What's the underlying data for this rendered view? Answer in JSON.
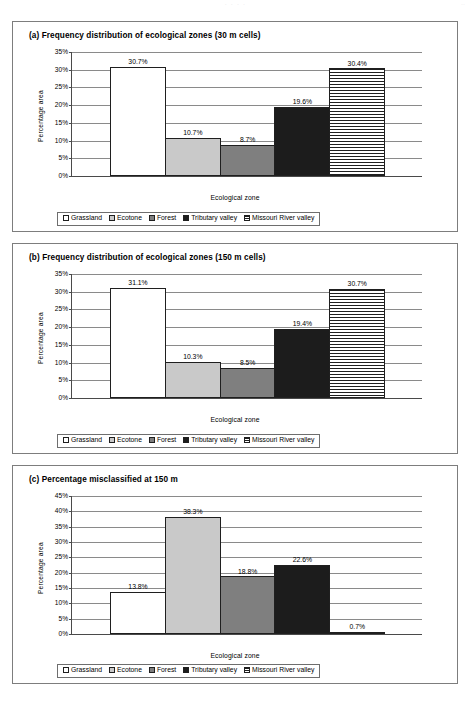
{
  "scan": {
    "header_artifact": "·   ·          ·                    ·",
    "folio_artifact": "··"
  },
  "legend": {
    "items": [
      {
        "label": "Grassland",
        "fill": "f-white",
        "color": "#ffffff"
      },
      {
        "label": "Ecotone",
        "fill": "f-ltgray",
        "color": "#c9c9c9"
      },
      {
        "label": "Forest",
        "fill": "f-gray",
        "color": "#7f7f7f"
      },
      {
        "label": "Tributary valley",
        "fill": "f-black",
        "color": "#1c1c1c"
      },
      {
        "label": "Missouri River valley",
        "fill": "f-stripe",
        "color": "#ffffff"
      }
    ]
  },
  "axis": {
    "ylabel": "Percentage area",
    "xlabel": "Ecological zone"
  },
  "panels": [
    {
      "id": "a",
      "title": "(a) Frequency distribution of ecological zones (30 m cells)"
    },
    {
      "id": "b",
      "title": "(b) Frequency distribution of ecological zones (150 m cells)"
    },
    {
      "id": "c",
      "title": "(c) Percentage misclassified at 150 m"
    }
  ],
  "chart_data": [
    {
      "type": "bar",
      "title": "(a) Frequency distribution of ecological zones (30 m cells)",
      "xlabel": "Ecological zone",
      "ylabel": "Percentage area",
      "categories": [
        "Grassland",
        "Ecotone",
        "Forest",
        "Tributary valley",
        "Missouri River valley"
      ],
      "values": [
        30.7,
        10.7,
        8.7,
        19.6,
        30.4
      ],
      "data_labels": [
        "30.7%",
        "10.7%",
        "8.7%",
        "19.6%",
        "30.4%"
      ],
      "ylim": [
        0,
        35
      ],
      "ytick_step": 5,
      "ytick_labels": [
        "0%",
        "5%",
        "10%",
        "15%",
        "20%",
        "25%",
        "30%",
        "35%"
      ],
      "grid": true,
      "legend_position": "bottom"
    },
    {
      "type": "bar",
      "title": "(b) Frequency distribution of ecological zones (150 m cells)",
      "xlabel": "Ecological zone",
      "ylabel": "Percentage area",
      "categories": [
        "Grassland",
        "Ecotone",
        "Forest",
        "Tributary valley",
        "Missouri River valley"
      ],
      "values": [
        31.1,
        10.3,
        8.5,
        19.4,
        30.7
      ],
      "data_labels": [
        "31.1%",
        "10.3%",
        "8.5%",
        "19.4%",
        "30.7%"
      ],
      "ylim": [
        0,
        35
      ],
      "ytick_step": 5,
      "ytick_labels": [
        "0%",
        "5%",
        "10%",
        "15%",
        "20%",
        "25%",
        "30%",
        "35%"
      ],
      "grid": true,
      "legend_position": "bottom"
    },
    {
      "type": "bar",
      "title": "(c) Percentage misclassified at 150 m",
      "xlabel": "Ecological zone",
      "ylabel": "Percentage area",
      "categories": [
        "Grassland",
        "Ecotone",
        "Forest",
        "Tributary valley",
        "Missouri River valley"
      ],
      "values": [
        13.8,
        38.3,
        18.8,
        22.6,
        0.7
      ],
      "data_labels": [
        "13.8%",
        "38.3%",
        "18.8%",
        "22.6%",
        "0.7%"
      ],
      "ylim": [
        0,
        45
      ],
      "ytick_step": 5,
      "ytick_labels": [
        "0%",
        "5%",
        "10%",
        "15%",
        "20%",
        "25%",
        "30%",
        "35%",
        "40%",
        "45%"
      ],
      "grid": true,
      "legend_position": "bottom"
    }
  ]
}
